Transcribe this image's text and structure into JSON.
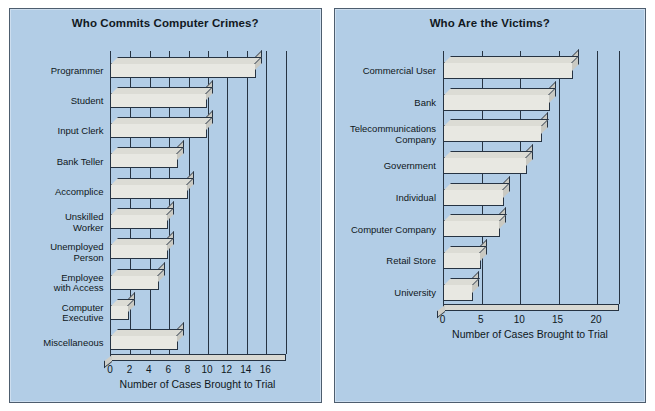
{
  "page": {
    "background": "#ffffff",
    "panel_background": "#b2cde6",
    "panel_border": "#4d5d6e",
    "bar_face": "#e8e8e2",
    "bar_side": "#c9c9c2",
    "ink": "#0f1720"
  },
  "charts": [
    {
      "id": "who-commits-computer-crimes",
      "chart_data": {
        "type": "bar",
        "orientation": "horizontal",
        "title": "Who Commits Computer Crimes?",
        "xlabel": "Number of Cases Brought to Trial",
        "ylabel": "",
        "xlim": [
          0,
          17
        ],
        "xticks": [
          0,
          2,
          4,
          6,
          8,
          10,
          12,
          14,
          16
        ],
        "xtick_labels": [
          "0",
          "2",
          "4",
          "6",
          "8",
          "10",
          "12",
          "14",
          "16"
        ],
        "grid": "vertical",
        "legend": "none",
        "categories": [
          "Programmer",
          "Student",
          "Input Clerk",
          "Bank Teller",
          "Accomplice",
          "Unskilled\nWorker",
          "Unemployed\nPerson",
          "Employee\nwith Access",
          "Computer\nExecutive",
          "Miscellaneous"
        ],
        "values": [
          15,
          10,
          10,
          7,
          8,
          6,
          6,
          5,
          2,
          7
        ]
      }
    },
    {
      "id": "who-are-the-victims",
      "chart_data": {
        "type": "bar",
        "orientation": "horizontal",
        "title": "Who Are the Victims?",
        "xlabel": "Number of Cases Brought to Trial",
        "ylabel": "",
        "xlim": [
          0,
          21.5
        ],
        "xticks": [
          0,
          5,
          10,
          15,
          20
        ],
        "xtick_labels": [
          "0",
          "5",
          "10",
          "15",
          "20"
        ],
        "grid": "vertical",
        "legend": "none",
        "categories": [
          "Commercial User",
          "Bank",
          "Telecommunications\nCompany",
          "Government",
          "Individual",
          "Computer Company",
          "Retail Store",
          "University"
        ],
        "values": [
          17,
          14,
          13,
          11,
          8,
          7.5,
          5,
          4
        ]
      }
    }
  ]
}
